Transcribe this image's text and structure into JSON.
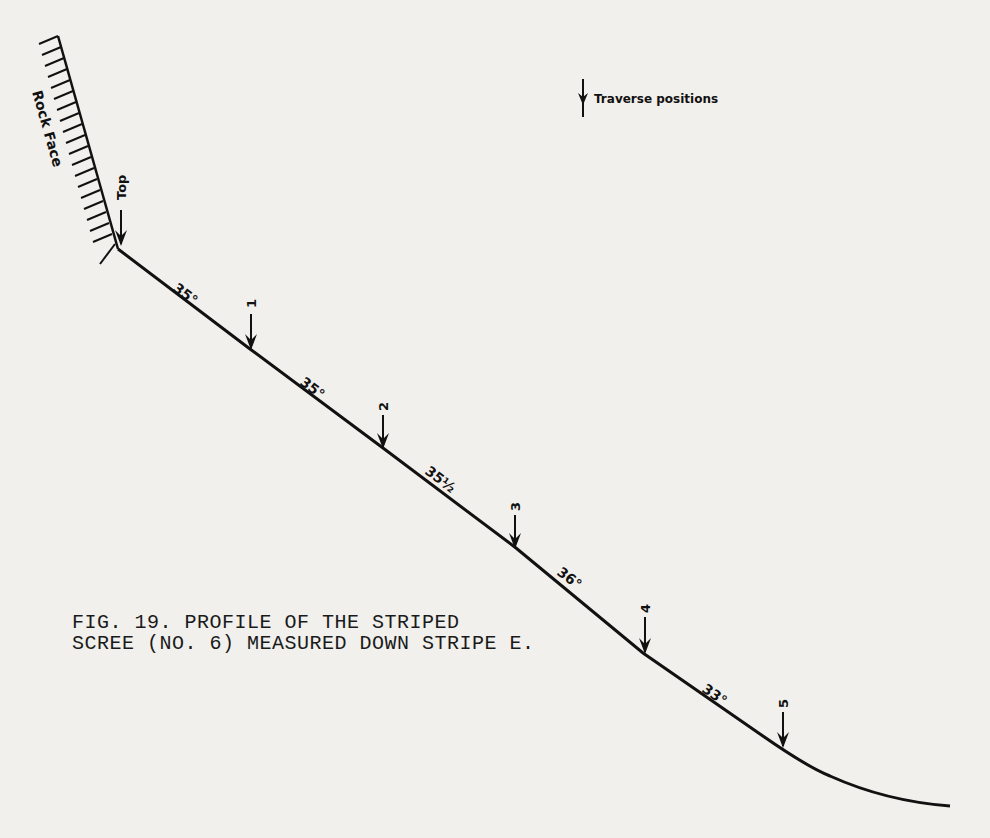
{
  "figure": {
    "caption_line1": "FIG. 19. PROFILE OF THE STRIPED",
    "caption_line2": "SCREE (NO. 6) MEASURED DOWN STRIPE E.",
    "rock_face_label": "Rock Face",
    "top_label": "Top",
    "legend_label": "Traverse positions",
    "legend_icon": "down-arrow-icon"
  },
  "slope_segments": [
    {
      "from": "Top",
      "to": "1",
      "angle": "35°"
    },
    {
      "from": "1",
      "to": "2",
      "angle": "35°"
    },
    {
      "from": "2",
      "to": "3",
      "angle": "35½°"
    },
    {
      "from": "3",
      "to": "4",
      "angle": "36°"
    },
    {
      "from": "4",
      "to": "5",
      "angle": "33°"
    }
  ],
  "traverse_positions": [
    "1",
    "2",
    "3",
    "4",
    "5"
  ],
  "labels": {
    "a1": "35°",
    "a2": "35°",
    "a3": "35½",
    "a4": "36°",
    "a5": "33°",
    "p1": "1",
    "p2": "2",
    "p3": "3",
    "p4": "4",
    "p5": "5"
  }
}
